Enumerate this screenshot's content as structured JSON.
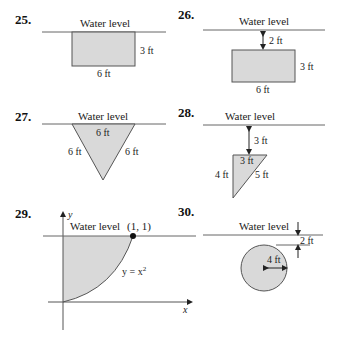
{
  "colors": {
    "fill": "#d9d9d9",
    "stroke": "#555555",
    "water_line": "#666666",
    "text": "#222222"
  },
  "water_level_label": "Water level",
  "problems": [
    {
      "number": "25.",
      "shape": "rectangle",
      "labels": {
        "height": "3 ft",
        "width": "6 ft"
      }
    },
    {
      "number": "26.",
      "shape": "rectangle",
      "labels": {
        "depth": "2 ft",
        "height": "3 ft",
        "width": "6 ft"
      }
    },
    {
      "number": "27.",
      "shape": "triangle",
      "labels": {
        "top": "6 ft",
        "left": "6 ft",
        "right": "6 ft"
      }
    },
    {
      "number": "28.",
      "shape": "right-triangle",
      "labels": {
        "depth": "3 ft",
        "top": "3 ft",
        "left": "4 ft",
        "hyp": "5 ft"
      }
    },
    {
      "number": "29.",
      "shape": "parabola-region",
      "labels": {
        "point": "(1, 1)",
        "curve": "y = x",
        "curve_exp": "2",
        "x_axis": "x",
        "y_axis": "y"
      }
    },
    {
      "number": "30.",
      "shape": "circle",
      "labels": {
        "depth": "2 ft",
        "radius": "4 ft"
      }
    }
  ]
}
